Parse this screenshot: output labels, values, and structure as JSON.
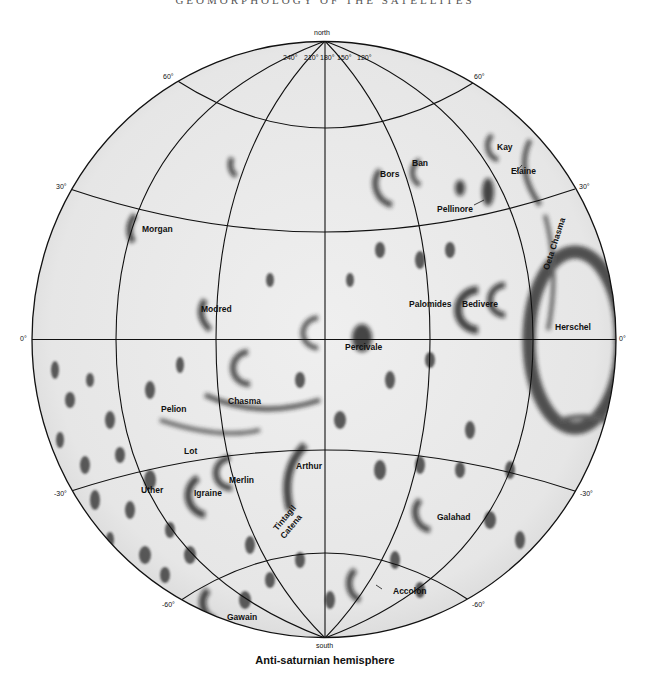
{
  "running_head": "GEOMORPHOLOGY OF THE SATELLITES",
  "caption": "Anti-saturnian hemisphere",
  "poles": {
    "north": "north",
    "south": "south"
  },
  "longitude_labels": [
    "240°",
    "210°",
    "180°",
    "150°",
    "120°"
  ],
  "latitude_labels": {
    "n60_left": "60°",
    "n60_right": "60°",
    "n30_left": "30°",
    "n30_right": "30°",
    "eq_left": "0°",
    "eq_right": "0°",
    "s30_left": "-30°",
    "s30_right": "-30°",
    "s60_left": "-60°",
    "s60_right": "-60°"
  },
  "features": {
    "kay": "Kay",
    "ban": "Ban",
    "bors": "Bors",
    "elaine": "Elaine",
    "pellinore": "Pellinore",
    "morgan": "Morgan",
    "oeta_chasma": "Oeta Chasma",
    "modred": "Modred",
    "palomides": "Palomides",
    "bedivere": "Bedivere",
    "herschel": "Herschel",
    "percivale": "Percivale",
    "pelion": "Pelion",
    "chasma": "Chasma",
    "lot": "Lot",
    "arthur": "Arthur",
    "merlin": "Merlin",
    "uther": "Uther",
    "igraine": "Igraine",
    "tintagil": "Tintagil",
    "catena": "Catena",
    "galahad": "Galahad",
    "accolon": "Accolon",
    "gawain": "Gawain"
  },
  "colors": {
    "surface": "#ececec",
    "shadow": "#1a1a1a",
    "grid": "#111111",
    "background": "#ffffff"
  }
}
